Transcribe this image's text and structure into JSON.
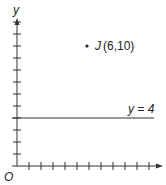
{
  "diagram": {
    "axes": {
      "x_label": "x",
      "y_label": "y",
      "origin_label": "O"
    },
    "point": {
      "name": "J",
      "coords": "(6,10)",
      "x": 6,
      "y": 10
    },
    "line": {
      "label": "y = 4",
      "value": 4
    },
    "x_ticks": 11,
    "y_ticks": 12
  }
}
